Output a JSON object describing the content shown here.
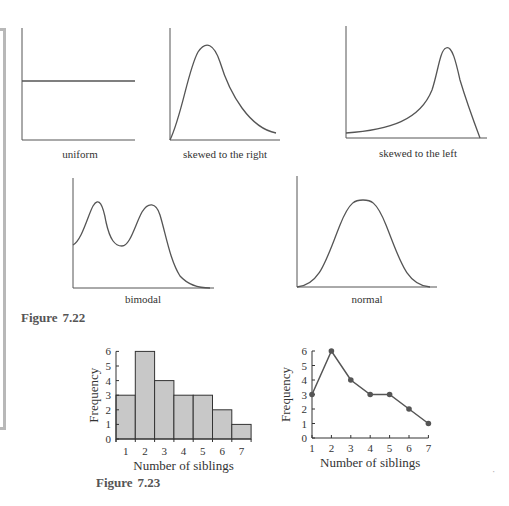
{
  "figure_722": {
    "label_prefix": "Figure",
    "label_number": "7.22",
    "shapes": [
      {
        "name": "uniform",
        "label": "uniform"
      },
      {
        "name": "skewed-right",
        "label": "skewed to the right"
      },
      {
        "name": "skewed-left",
        "label": "skewed to the left"
      },
      {
        "name": "bimodal",
        "label": "bimodal"
      },
      {
        "name": "normal",
        "label": "normal"
      }
    ]
  },
  "figure_723": {
    "label_prefix": "Figure",
    "label_number": "7.23"
  },
  "chart_data": [
    {
      "type": "bar",
      "title": "",
      "xlabel": "Number of siblings",
      "ylabel": "Frequency",
      "categories": [
        "1",
        "2",
        "3",
        "4",
        "5",
        "6",
        "7"
      ],
      "values": [
        3,
        6,
        4,
        3,
        3,
        2,
        1
      ],
      "yticks": [
        "0",
        "1",
        "2",
        "3",
        "4",
        "5",
        "6"
      ],
      "ylim": [
        0,
        6
      ],
      "grid": false,
      "bar_fill": "#c8c8c8"
    },
    {
      "type": "line",
      "title": "",
      "xlabel": "Number of siblings",
      "ylabel": "Frequency",
      "x": [
        1,
        2,
        3,
        4,
        5,
        6,
        7
      ],
      "values": [
        3,
        6,
        4,
        3,
        3,
        2,
        1
      ],
      "xticks": [
        "1",
        "2",
        "3",
        "4",
        "5",
        "6",
        "7"
      ],
      "yticks": [
        "0",
        "1",
        "2",
        "3",
        "4",
        "5",
        "6"
      ],
      "ylim": [
        0,
        6
      ],
      "grid": false,
      "line_color": "#555555"
    }
  ]
}
